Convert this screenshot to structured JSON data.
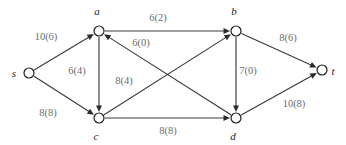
{
  "figure": {
    "type": "flow-network-diagram",
    "background_color": "#ffffff",
    "edge_color": "#3a3a3a",
    "node_stroke_color": "#1c1c1c",
    "node_fill_color": "#ffffff",
    "label_color": "#6b6b6b",
    "node_label_color": "#1c1c1c"
  },
  "nodes": [
    {
      "id": "s",
      "label": "s",
      "x": 29,
      "y": 73,
      "r": 5,
      "label_x": 14,
      "label_y": 77
    },
    {
      "id": "a",
      "label": "a",
      "x": 99,
      "y": 31,
      "r": 5,
      "label_x": 97,
      "label_y": 15
    },
    {
      "id": "b",
      "label": "b",
      "x": 236,
      "y": 31,
      "r": 5,
      "label_x": 234,
      "label_y": 15
    },
    {
      "id": "c",
      "label": "c",
      "x": 99,
      "y": 118,
      "r": 5,
      "label_x": 96,
      "label_y": 140
    },
    {
      "id": "d",
      "label": "d",
      "x": 236,
      "y": 118,
      "r": 5,
      "label_x": 233,
      "label_y": 140
    },
    {
      "id": "t",
      "label": "t",
      "x": 322,
      "y": 70,
      "r": 5,
      "label_x": 333,
      "label_y": 75
    }
  ],
  "edges": [
    {
      "id": "s-a",
      "from": "s",
      "to": "a",
      "capacity": 10,
      "flow": 6,
      "label": "10(6)",
      "label_x": 46,
      "label_y": 40
    },
    {
      "id": "s-c",
      "from": "s",
      "to": "c",
      "capacity": 8,
      "flow": 8,
      "label": "8(8)",
      "label_x": 48,
      "label_y": 116
    },
    {
      "id": "a-b",
      "from": "a",
      "to": "b",
      "capacity": 6,
      "flow": 2,
      "label": "6(2)",
      "label_x": 158,
      "label_y": 21
    },
    {
      "id": "a-c",
      "from": "a",
      "to": "c",
      "capacity": 6,
      "flow": 4,
      "label": "6(4)",
      "label_x": 77,
      "label_y": 74
    },
    {
      "id": "d-a",
      "from": "d",
      "to": "a",
      "capacity": 6,
      "flow": 0,
      "label": "6(0)",
      "label_x": 141,
      "label_y": 46
    },
    {
      "id": "c-b",
      "from": "c",
      "to": "b",
      "capacity": 8,
      "flow": 4,
      "label": "8(4)",
      "label_x": 124,
      "label_y": 84
    },
    {
      "id": "b-d",
      "from": "b",
      "to": "d",
      "capacity": 7,
      "flow": 0,
      "label": "7(0)",
      "label_x": 248,
      "label_y": 74
    },
    {
      "id": "c-d",
      "from": "c",
      "to": "d",
      "capacity": 8,
      "flow": 8,
      "label": "8(8)",
      "label_x": 168,
      "label_y": 134
    },
    {
      "id": "b-t",
      "from": "b",
      "to": "t",
      "capacity": 8,
      "flow": 6,
      "label": "8(6)",
      "label_x": 288,
      "label_y": 41
    },
    {
      "id": "d-t",
      "from": "d",
      "to": "t",
      "capacity": 10,
      "flow": 8,
      "label": "10(8)",
      "label_x": 294,
      "label_y": 107
    }
  ]
}
